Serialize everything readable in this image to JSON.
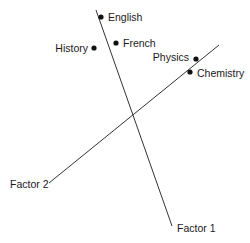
{
  "diagram": {
    "type": "factor-loading-plot",
    "colors": {
      "background": "#ffffff",
      "axis_line": "#333333",
      "point": "#111111",
      "text": "#1a1a1a"
    },
    "axes": [
      {
        "id": "factor1",
        "label": "Factor 1",
        "start": {
          "x": 96,
          "y": 10
        },
        "end": {
          "x": 172,
          "y": 226
        },
        "label_pos": {
          "x": 177,
          "y": 232
        }
      },
      {
        "id": "factor2",
        "label": "Factor 2",
        "start": {
          "x": 49,
          "y": 183
        },
        "end": {
          "x": 219,
          "y": 45
        },
        "label_pos": {
          "x": 10,
          "y": 188
        }
      }
    ],
    "points": [
      {
        "name": "English",
        "x": 101,
        "y": 17,
        "label_x": 108,
        "label_y": 21,
        "anchor": "start"
      },
      {
        "name": "History",
        "x": 94,
        "y": 48,
        "label_x": 88,
        "label_y": 52,
        "anchor": "end"
      },
      {
        "name": "French",
        "x": 116,
        "y": 43,
        "label_x": 123,
        "label_y": 47,
        "anchor": "start"
      },
      {
        "name": "Physics",
        "x": 196,
        "y": 59,
        "label_x": 189,
        "label_y": 61,
        "anchor": "end"
      },
      {
        "name": "Chemistry",
        "x": 190,
        "y": 72,
        "label_x": 197,
        "label_y": 77,
        "anchor": "start"
      }
    ]
  }
}
